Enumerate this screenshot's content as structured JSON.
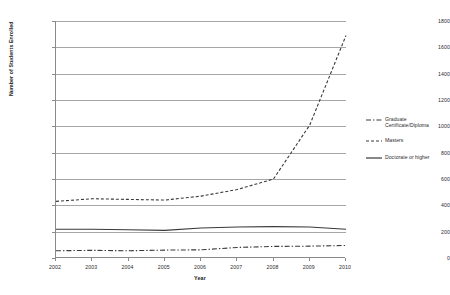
{
  "chart_data": {
    "type": "line",
    "title": "",
    "xlabel": "Year",
    "ylabel": "Number of Students Enrolled",
    "x": [
      2002,
      2003,
      2004,
      2005,
      2006,
      2007,
      2008,
      2009,
      2010
    ],
    "categories": [
      "2002",
      "2003",
      "2004",
      "2005",
      "2006",
      "2007",
      "2008",
      "2009",
      "2010"
    ],
    "xlim": [
      2002,
      2010
    ],
    "ylim": [
      0,
      1800
    ],
    "ytick_labels": [
      "0",
      "200",
      "400",
      "600",
      "800",
      "1000",
      "1200",
      "1400",
      "1600",
      "1800"
    ],
    "yticks": [
      0,
      200,
      400,
      600,
      800,
      1000,
      1200,
      1400,
      1600,
      1800
    ],
    "grid": "horizontal",
    "legend_position": "right",
    "series": [
      {
        "name": "Graduate Certificate/Diploma",
        "line_style": "dash-dot",
        "color": "#3a3a3a",
        "values": [
          55,
          58,
          55,
          60,
          62,
          80,
          88,
          90,
          95
        ]
      },
      {
        "name": "Masters",
        "line_style": "dashed",
        "color": "#3a3a3a",
        "values": [
          430,
          450,
          445,
          440,
          470,
          520,
          600,
          1010,
          1690
        ]
      },
      {
        "name": "Doctorate or higher",
        "line_style": "solid",
        "color": "#3a3a3a",
        "values": [
          218,
          218,
          215,
          210,
          228,
          235,
          238,
          235,
          218
        ]
      }
    ]
  },
  "axis": {
    "y_title": "Number of Students Enrolled",
    "x_title": "Year"
  },
  "legend": {
    "items": [
      {
        "label_line1": "Graduate",
        "label_line2": "Certificate/Diploma",
        "style": "dash-dot"
      },
      {
        "label_line1": "Masters",
        "label_line2": "",
        "style": "dashed"
      },
      {
        "label_line1": "Doctorate or higher",
        "label_line2": "",
        "style": "solid"
      }
    ]
  },
  "colors": {
    "line": "#3a3a3a",
    "grid": "#a6a6a6",
    "axis": "#8a8a8a",
    "text": "#2b2b2b"
  }
}
